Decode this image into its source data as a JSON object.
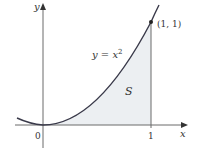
{
  "figure": {
    "y_axis_label": "y",
    "x_axis_label": "x",
    "origin_label": "0",
    "x_tick_label": "1",
    "curve_label_lhs": "y = x",
    "curve_label_exp": "2",
    "point_label": "(1, 1)",
    "region_label": "S"
  },
  "colors": {
    "curve": "#3a3a4a",
    "axes": "#6a6a6a",
    "region_fill": "#eceff2",
    "text": "#333333"
  }
}
